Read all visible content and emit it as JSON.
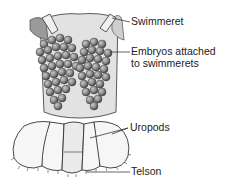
{
  "diagram": {
    "labels": {
      "swimmeret": "Swimmeret",
      "embryos_line1": "Embryos attached",
      "embryos_line2": "to swimmerets",
      "uropods": "Uropods",
      "telson": "Telson"
    },
    "colors": {
      "ink": "#222222",
      "egg_fill": "#8a8a8a",
      "egg_dark": "#555555",
      "body_shade": "#d8d8d8",
      "fan_fill": "#f4f4f4"
    }
  }
}
